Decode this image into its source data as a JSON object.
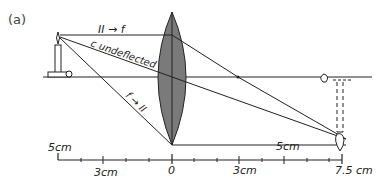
{
  "figure": {
    "panel_label": "(a)",
    "colors": {
      "ink": "#222222",
      "lens_fill": "#7a7a7a"
    }
  },
  "rays": {
    "parallel_label": "II → f",
    "center_label": "c undeflected",
    "focal_label": "f → II"
  },
  "ruler": {
    "object_distance_label": "5cm",
    "image_distance_label": "5cm",
    "tick_labels": [
      "3cm",
      "0",
      "3cm",
      "7.5 cm"
    ]
  }
}
